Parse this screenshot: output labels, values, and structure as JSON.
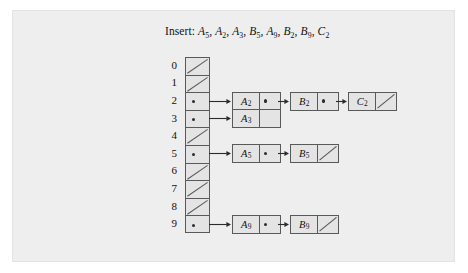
{
  "figure": {
    "caption": {
      "prefix": "Insert:",
      "keys": [
        {
          "letter": "A",
          "sub": "5"
        },
        {
          "letter": "A",
          "sub": "2"
        },
        {
          "letter": "A",
          "sub": "3"
        },
        {
          "letter": "B",
          "sub": "5"
        },
        {
          "letter": "A",
          "sub": "9"
        },
        {
          "letter": "B",
          "sub": "2"
        },
        {
          "letter": "B",
          "sub": "9"
        },
        {
          "letter": "C",
          "sub": "2"
        }
      ]
    },
    "colors": {
      "panel_background": "#eeeeee",
      "cell_fill": "#e4e4e4",
      "stroke": "#595959",
      "text": "#111111",
      "arrow": "#2b2b2b"
    },
    "table": {
      "slot_count": 10,
      "slots": [
        {
          "index": "0",
          "occupied": false,
          "chain": []
        },
        {
          "index": "1",
          "occupied": false,
          "chain": []
        },
        {
          "index": "2",
          "occupied": true,
          "chain": [
            {
              "letter": "A",
              "sub": "2",
              "next": true
            },
            {
              "letter": "B",
              "sub": "2",
              "next": true
            },
            {
              "letter": "C",
              "sub": "2",
              "next": false
            }
          ]
        },
        {
          "index": "3",
          "occupied": true,
          "chain": [
            {
              "letter": "A",
              "sub": "3",
              "next": false,
              "blank_tail": true
            }
          ]
        },
        {
          "index": "4",
          "occupied": false,
          "chain": []
        },
        {
          "index": "5",
          "occupied": true,
          "chain": [
            {
              "letter": "A",
              "sub": "5",
              "next": true
            },
            {
              "letter": "B",
              "sub": "5",
              "next": false
            }
          ]
        },
        {
          "index": "6",
          "occupied": false,
          "chain": []
        },
        {
          "index": "7",
          "occupied": false,
          "chain": []
        },
        {
          "index": "8",
          "occupied": false,
          "chain": []
        },
        {
          "index": "9",
          "occupied": true,
          "chain": [
            {
              "letter": "A",
              "sub": "9",
              "next": true
            },
            {
              "letter": "B",
              "sub": "9",
              "next": false
            }
          ]
        }
      ]
    }
  }
}
